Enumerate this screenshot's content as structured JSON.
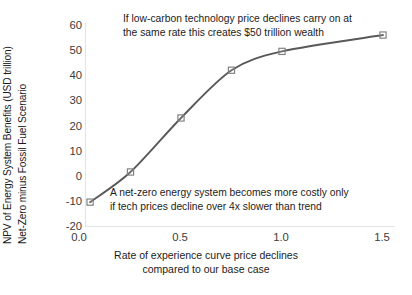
{
  "chart_data": {
    "type": "line",
    "title": "",
    "xlabel": "Rate of experience curve price declines compared to our base case",
    "ylabel": "NPV of Energy System Benefits (USD trillion) Net-Zero minus Fossil Fuel Scenario",
    "x": [
      0.05,
      0.25,
      0.5,
      0.75,
      1.0,
      1.5
    ],
    "values": [
      -10.5,
      1.5,
      23,
      42,
      49.5,
      56
    ],
    "xlim": [
      0.0,
      1.55
    ],
    "ylim": [
      -20,
      60
    ],
    "xticks": [
      "0.0",
      "0.5",
      "1.0",
      "1.5"
    ],
    "xtick_values": [
      0.0,
      0.5,
      1.0,
      1.5
    ],
    "yticks": [
      "60",
      "50",
      "40",
      "30",
      "20",
      "10",
      "0",
      "-10",
      "-20"
    ],
    "ytick_values": [
      60,
      50,
      40,
      30,
      20,
      10,
      0,
      -10,
      -20
    ],
    "grid": false,
    "legend": "none",
    "marker": "open-square",
    "line_color": "#595959",
    "marker_color": "#7f7f7f",
    "annotations": [
      {
        "name": "top-annotation",
        "lines": [
          "If low-carbon technology price declines carry on at",
          "the same rate this creates $50 trillion wealth"
        ]
      },
      {
        "name": "bottom-annotation",
        "lines": [
          "A net-zero energy system becomes more costly only",
          "if tech prices decline over 4x slower than trend"
        ]
      }
    ]
  },
  "axes": {
    "y_title_line1": "NPV of Energy System Benefits (USD trillion)",
    "y_title_line2": "Net-Zero minus Fossil Fuel Scenario",
    "x_title_line1": "Rate of experience curve price declines",
    "x_title_line2": "compared to our base case"
  },
  "colors": {
    "line": "#595959",
    "marker_stroke": "#808080",
    "axis": "#e4e4e4",
    "text": "#1c1c1c",
    "tick_text": "#3b3b3b",
    "background": "#ffffff"
  }
}
